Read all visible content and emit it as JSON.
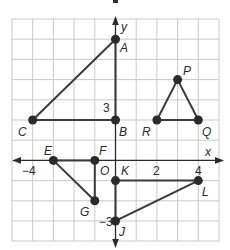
{
  "diagram": {
    "axes": {
      "x_label": "x",
      "y_label": "y",
      "origin_label": "O",
      "x_range": [
        -5,
        5
      ],
      "y_range": [
        -4,
        7
      ],
      "tick_labels": [
        {
          "axis": "x",
          "value": -4,
          "text": "−4"
        },
        {
          "axis": "x",
          "value": 2,
          "text": "2"
        },
        {
          "axis": "x",
          "value": 4,
          "text": "4"
        },
        {
          "axis": "y",
          "value": 3,
          "text": "3"
        },
        {
          "axis": "y",
          "value": -3,
          "text": "−3"
        }
      ]
    },
    "points": {
      "A": {
        "label": "A",
        "x": 0,
        "y": 6
      },
      "B": {
        "label": "B",
        "x": 0,
        "y": 2
      },
      "C": {
        "label": "C",
        "x": -4,
        "y": 2
      },
      "P": {
        "label": "P",
        "x": 3,
        "y": 4
      },
      "R": {
        "label": "R",
        "x": 2,
        "y": 2
      },
      "Q": {
        "label": "Q",
        "x": 4,
        "y": 2
      },
      "E": {
        "label": "E",
        "x": -3,
        "y": 0
      },
      "F": {
        "label": "F",
        "x": -1,
        "y": 0
      },
      "G": {
        "label": "G",
        "x": -1,
        "y": -2
      },
      "K": {
        "label": "K",
        "x": 0,
        "y": -1
      },
      "L": {
        "label": "L",
        "x": 4,
        "y": -1
      },
      "J": {
        "label": "J",
        "x": 0,
        "y": -3
      }
    },
    "triangles": [
      {
        "name": "ABC",
        "vertices": [
          "A",
          "B",
          "C"
        ]
      },
      {
        "name": "PQR",
        "vertices": [
          "P",
          "Q",
          "R"
        ]
      },
      {
        "name": "EFG",
        "vertices": [
          "E",
          "F",
          "G"
        ]
      },
      {
        "name": "JKL",
        "vertices": [
          "J",
          "K",
          "L"
        ]
      }
    ],
    "colors": {
      "grid": "#c9c9c9",
      "lines": "#3a3a3a",
      "points": "#2a2a2a"
    }
  }
}
